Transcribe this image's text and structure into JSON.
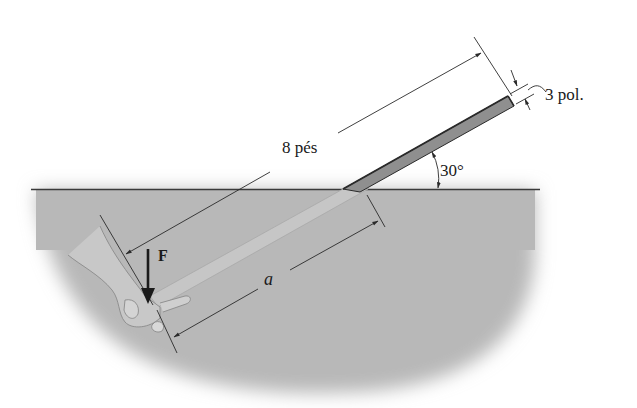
{
  "figure": {
    "labels": {
      "length": "8 pés",
      "thickness": "3 pol.",
      "angle": "30°",
      "submerged_length": "a",
      "force": "F"
    },
    "colors": {
      "water": "#b9b9b9",
      "rod": "#9a9a9a",
      "rod_submerged": "#c2c2c2",
      "lines": "#2a2a2a",
      "background": "#ffffff"
    }
  }
}
